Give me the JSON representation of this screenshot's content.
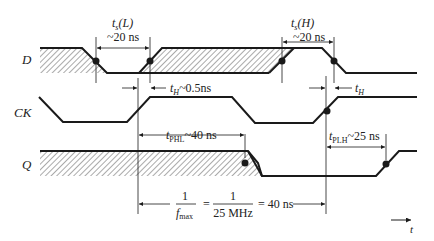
{
  "diagram": {
    "type": "timing-diagram",
    "signals": [
      {
        "name": "D",
        "label": "D"
      },
      {
        "name": "CK",
        "label": "CK"
      },
      {
        "name": "Q",
        "label": "Q"
      }
    ],
    "annotations": {
      "ts_low": {
        "symbol": "t",
        "sub": "s",
        "paren": "(L)",
        "value": "~20 ns"
      },
      "ts_high": {
        "symbol": "t",
        "sub": "s",
        "paren": "(H)",
        "value": "~20 ns"
      },
      "th_1": {
        "symbol": "t",
        "sub": "H",
        "value": "~0.5ns"
      },
      "th_2": {
        "symbol": "t",
        "sub": "H"
      },
      "tphl": {
        "symbol": "t",
        "sub": "PHL",
        "value": "~40 ns"
      },
      "tplh": {
        "symbol": "t",
        "sub": "PLH",
        "value": "~25 ns"
      },
      "fmax": {
        "numerator": "1",
        "denominator_sym": "f",
        "denominator_sub": "max",
        "eq1": "=",
        "num2": "1",
        "den2": "25 MHz",
        "result": "= 40 ns"
      }
    },
    "time_axis": {
      "label": "t"
    },
    "colors": {
      "line": "#1a1a1a",
      "hatch": "#555555",
      "background": "#ffffff"
    }
  }
}
